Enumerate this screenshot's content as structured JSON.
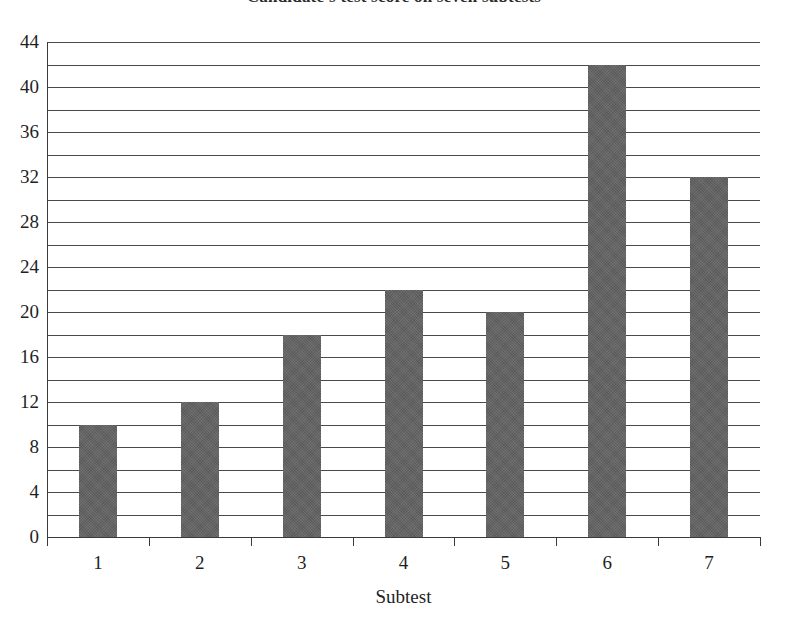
{
  "chart_data": {
    "type": "bar",
    "title": "Candidate's test score on seven subtests",
    "xlabel": "Subtest",
    "ylabel": "",
    "categories": [
      "1",
      "2",
      "3",
      "4",
      "5",
      "6",
      "7"
    ],
    "values": [
      10,
      12,
      18,
      22,
      20,
      42,
      32
    ],
    "ylim": [
      0,
      44
    ],
    "y_major_ticks": [
      0,
      4,
      8,
      12,
      16,
      20,
      24,
      28,
      32,
      36,
      40,
      44
    ],
    "y_minor_gridlines": [
      2,
      6,
      10,
      14,
      18,
      22,
      26,
      30,
      34,
      38,
      42
    ],
    "y_tick_labels": [
      "0",
      "4",
      "8",
      "12",
      "16",
      "20",
      "24",
      "28",
      "32",
      "36",
      "40",
      "44"
    ],
    "grid": true,
    "legend": null,
    "bar_color": "#636363",
    "gridline_color": "#4a4a4a",
    "axis_color": "#3a3a3a",
    "background": "#ffffff"
  }
}
